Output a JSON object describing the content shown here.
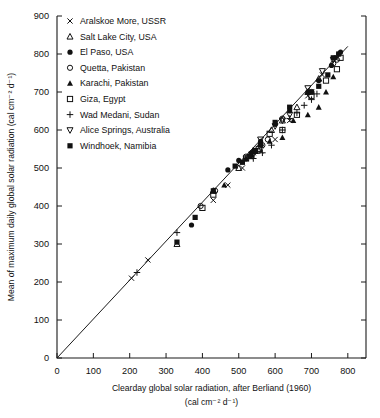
{
  "chart_data": {
    "type": "scatter",
    "title": "",
    "xlabel": "Clearday global solar radiation, after Berliand (1960)",
    "xlabel2": "(cal cm⁻² d⁻¹)",
    "ylabel": "Mean of maximum daily global solar radiation (cal cm⁻² d⁻¹)",
    "xlim": [
      0,
      850
    ],
    "ylim": [
      0,
      900
    ],
    "xticks": [
      0,
      100,
      200,
      300,
      400,
      500,
      600,
      700,
      800
    ],
    "yticks": [
      0,
      100,
      200,
      300,
      400,
      500,
      600,
      700,
      800,
      900
    ],
    "grid": false,
    "legend_position": "top-left",
    "reference_line": {
      "label": "1:1 fit line",
      "from": [
        0,
        0
      ],
      "to": [
        800,
        820
      ]
    },
    "series": [
      {
        "name": "Aralskoe More, USSR",
        "marker": "cross-x",
        "filled": false,
        "points": [
          [
            205,
            210
          ],
          [
            250,
            258
          ],
          [
            430,
            415
          ],
          [
            470,
            455
          ],
          [
            510,
            500
          ],
          [
            530,
            530
          ],
          [
            540,
            540
          ],
          [
            560,
            545
          ],
          [
            600,
            575
          ],
          [
            640,
            625
          ],
          [
            690,
            690
          ],
          [
            700,
            700
          ],
          [
            730,
            745
          ]
        ]
      },
      {
        "name": "Salt Lake City, USA",
        "marker": "triangle-up",
        "filled": false,
        "points": [
          [
            330,
            300
          ],
          [
            430,
            440
          ],
          [
            500,
            500
          ],
          [
            540,
            545
          ],
          [
            560,
            565
          ],
          [
            590,
            600
          ],
          [
            620,
            625
          ],
          [
            660,
            660
          ],
          [
            690,
            700
          ],
          [
            720,
            735
          ]
        ]
      },
      {
        "name": "El Paso, USA",
        "marker": "circle",
        "filled": true,
        "points": [
          [
            370,
            350
          ],
          [
            470,
            495
          ],
          [
            500,
            520
          ],
          [
            535,
            540
          ],
          [
            545,
            545
          ],
          [
            560,
            570
          ],
          [
            600,
            615
          ],
          [
            640,
            650
          ],
          [
            690,
            700
          ],
          [
            720,
            730
          ],
          [
            755,
            770
          ],
          [
            765,
            790
          ],
          [
            775,
            800
          ],
          [
            780,
            805
          ]
        ]
      },
      {
        "name": "Quetta, Pakistan",
        "marker": "circle",
        "filled": false,
        "points": [
          [
            395,
            400
          ],
          [
            435,
            440
          ],
          [
            520,
            530
          ],
          [
            540,
            540
          ],
          [
            555,
            545
          ],
          [
            565,
            560
          ],
          [
            580,
            575
          ],
          [
            620,
            630
          ],
          [
            700,
            700
          ],
          [
            760,
            775
          ],
          [
            770,
            785
          ]
        ]
      },
      {
        "name": "Karachi, Pakistan",
        "marker": "triangle-up",
        "filled": true,
        "points": [
          [
            460,
            455
          ],
          [
            520,
            525
          ],
          [
            535,
            535
          ],
          [
            585,
            570
          ],
          [
            620,
            580
          ],
          [
            650,
            625
          ],
          [
            690,
            640
          ],
          [
            720,
            660
          ],
          [
            740,
            700
          ],
          [
            760,
            740
          ]
        ]
      },
      {
        "name": "Giza, Egypt",
        "marker": "square",
        "filled": false,
        "points": [
          [
            400,
            395
          ],
          [
            430,
            430
          ],
          [
            520,
            525
          ],
          [
            535,
            535
          ],
          [
            545,
            545
          ],
          [
            555,
            550
          ],
          [
            585,
            590
          ],
          [
            620,
            600
          ],
          [
            660,
            640
          ],
          [
            700,
            690
          ],
          [
            740,
            730
          ],
          [
            770,
            760
          ],
          [
            780,
            790
          ]
        ]
      },
      {
        "name": "Wad Medani, Sudan",
        "marker": "plus",
        "filled": false,
        "points": [
          [
            220,
            225
          ],
          [
            330,
            330
          ],
          [
            520,
            525
          ],
          [
            540,
            525
          ],
          [
            565,
            540
          ],
          [
            590,
            560
          ],
          [
            620,
            600
          ],
          [
            640,
            630
          ],
          [
            660,
            645
          ],
          [
            680,
            665
          ],
          [
            700,
            680
          ],
          [
            715,
            695
          ]
        ]
      },
      {
        "name": "Alice Springs, Australia",
        "marker": "triangle-down",
        "filled": false,
        "points": [
          [
            560,
            575
          ],
          [
            600,
            610
          ],
          [
            620,
            625
          ],
          [
            640,
            640
          ],
          [
            690,
            710
          ],
          [
            730,
            755
          ],
          [
            760,
            785
          ]
        ]
      },
      {
        "name": "Windhoek, Namibia",
        "marker": "square",
        "filled": true,
        "points": [
          [
            330,
            305
          ],
          [
            380,
            370
          ],
          [
            430,
            440
          ],
          [
            490,
            505
          ],
          [
            510,
            515
          ],
          [
            530,
            530
          ],
          [
            545,
            545
          ],
          [
            560,
            560
          ],
          [
            600,
            620
          ],
          [
            640,
            660
          ],
          [
            700,
            700
          ],
          [
            720,
            715
          ],
          [
            745,
            745
          ],
          [
            760,
            790
          ],
          [
            775,
            800
          ]
        ]
      }
    ]
  },
  "legend": {
    "items": [
      {
        "label": "Aralskoe More, USSR",
        "marker": "cross-x-icon"
      },
      {
        "label": "Salt Lake City, USA",
        "marker": "triangle-up-outline-icon"
      },
      {
        "label": "El Paso, USA",
        "marker": "circle-filled-icon"
      },
      {
        "label": "Quetta, Pakistan",
        "marker": "circle-outline-icon"
      },
      {
        "label": "Karachi, Pakistan",
        "marker": "triangle-up-filled-icon"
      },
      {
        "label": "Giza, Egypt",
        "marker": "square-outline-icon"
      },
      {
        "label": "Wad Medani, Sudan",
        "marker": "plus-icon"
      },
      {
        "label": "Alice Springs, Australia",
        "marker": "triangle-down-outline-icon"
      },
      {
        "label": "Windhoek, Namibia",
        "marker": "square-filled-icon"
      }
    ]
  },
  "colors": {
    "ink": "#111111",
    "background": "#ffffff"
  }
}
